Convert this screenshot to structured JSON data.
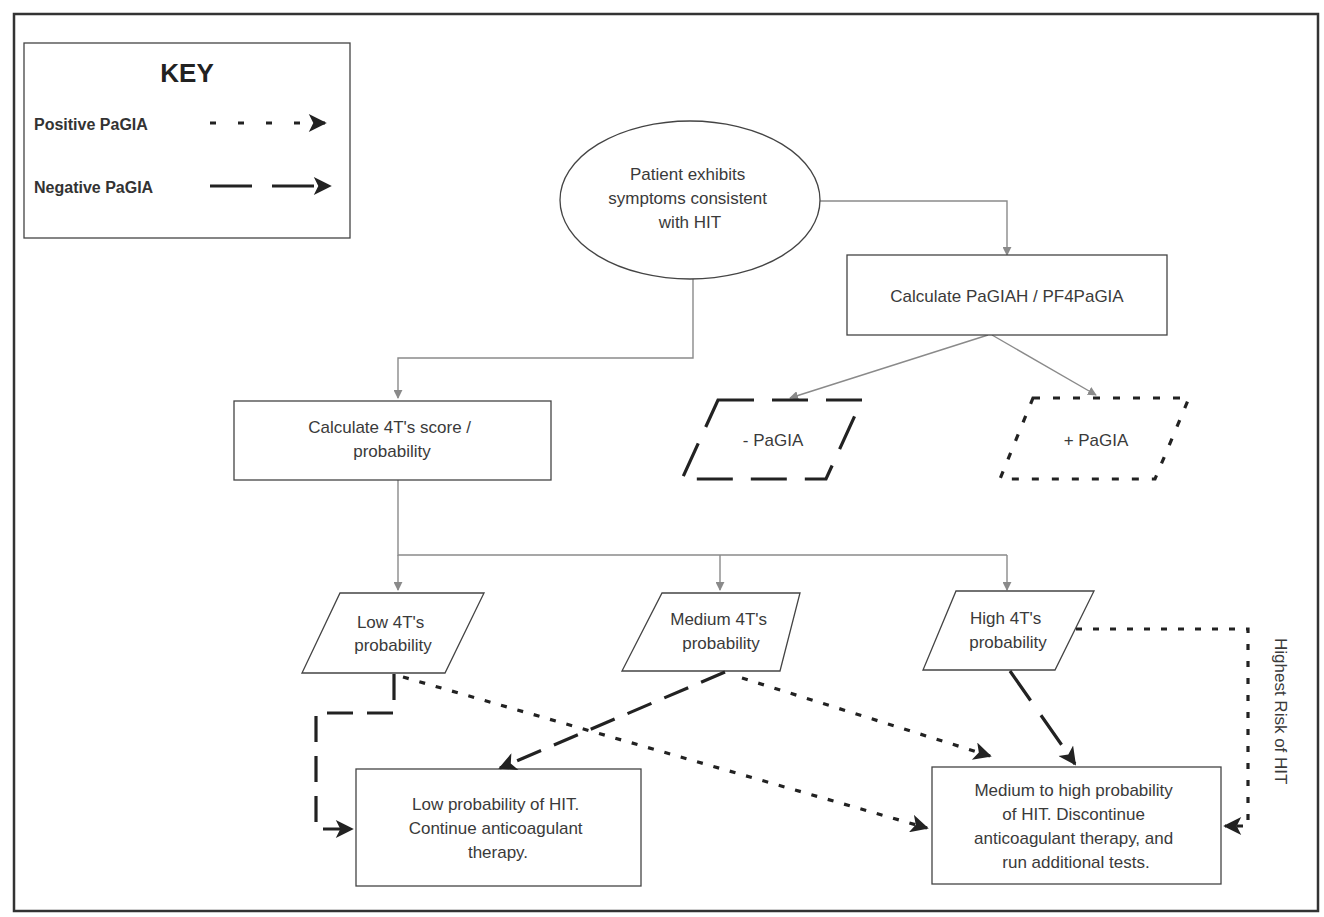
{
  "key": {
    "title": "KEY",
    "items": [
      {
        "label": "Positive PaGIA",
        "style": "short-dash"
      },
      {
        "label": "Negative PaGIA",
        "style": "long-dash"
      }
    ]
  },
  "nodes": {
    "start": {
      "lines": [
        "Patient exhibits",
        "symptoms consistent",
        "with HIT"
      ],
      "shape": "ellipse"
    },
    "pagia_calc": {
      "lines": [
        "Calculate PaGIAH / PF4PaGIA"
      ],
      "shape": "rectangle"
    },
    "neg_pagia": {
      "lines": [
        "- PaGIA"
      ],
      "shape": "parallelogram-long-dash"
    },
    "pos_pagia": {
      "lines": [
        "+ PaGIA"
      ],
      "shape": "parallelogram-short-dash"
    },
    "fourT_calc": {
      "lines": [
        "Calculate 4T's score /",
        "probability"
      ],
      "shape": "rectangle"
    },
    "low_4t": {
      "lines": [
        "Low 4T's",
        "probability"
      ],
      "shape": "parallelogram"
    },
    "medium_4t": {
      "lines": [
        "Medium 4T's",
        "probability"
      ],
      "shape": "parallelogram"
    },
    "high_4t": {
      "lines": [
        "High 4T's",
        "probability"
      ],
      "shape": "parallelogram"
    },
    "low_outcome": {
      "lines": [
        "Low probability of HIT.",
        "Continue anticoagulant",
        "therapy."
      ],
      "shape": "rectangle"
    },
    "high_outcome": {
      "lines": [
        "Medium to high probability",
        "of HIT. Discontinue",
        "anticoagulant therapy, and",
        "run additional tests."
      ],
      "shape": "rectangle"
    }
  },
  "side_label": "Highest Risk of HIT",
  "colors": {
    "outline": "#444444",
    "thin_connector": "#8a8a8a",
    "emphasis_arrow": "#222222",
    "background": "#ffffff"
  }
}
